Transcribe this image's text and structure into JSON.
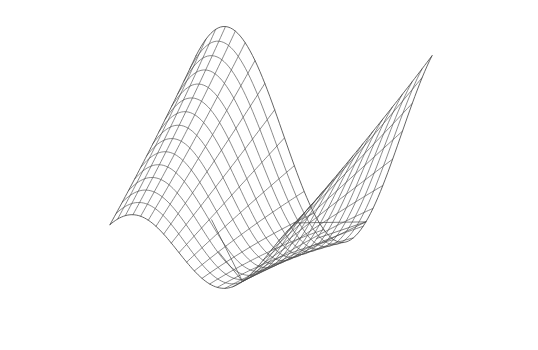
{
  "figure": {
    "title": "",
    "background_color": "#ffffff",
    "width": 538,
    "height": 350,
    "caption_fragment": ""
  },
  "chart_data": {
    "type": "line",
    "subtype": "3d-wireframe-surface",
    "title": "",
    "subtitle": "",
    "xlabel": "",
    "ylabel": "",
    "zlabel": "",
    "grid": false,
    "legend": false,
    "legend_position": "none",
    "axes_visible": false,
    "tick_labels_x": [],
    "tick_labels_y": [],
    "tick_labels_z": [],
    "annotations": [],
    "surface": {
      "description": "Single-period sinusoidal ridge-and-valley (saddle-like wave) surface drawn as a quadrilateral wireframe mesh with no shading or fill.",
      "function": "z = amplitude * cos(2*pi*(u - phase))",
      "amplitude": 1.0,
      "phase": 0.12,
      "u_range": [
        0,
        1
      ],
      "v_range": [
        0,
        1
      ],
      "u_divisions": 24,
      "v_divisions": 14,
      "wire_color": "#4a4a4a",
      "wire_width": 0.7,
      "hidden_line_removal": false
    },
    "projection": {
      "type": "oblique-perspective",
      "azimuth_deg": -48,
      "elevation_deg": 22,
      "origin_px": [
        258,
        176
      ],
      "scale_x_px": 236,
      "scale_y_px": 118,
      "scale_z_px": 108,
      "shear_px": 112
    },
    "chords": [
      {
        "name": "chord-top-node-to-valley",
        "from_uv": [
          0.72,
          0.0
        ],
        "to_uv": [
          0.72,
          1.0
        ]
      },
      {
        "name": "chord-upper-fan-a",
        "from_uv": [
          0.72,
          0.0
        ],
        "to_uv": [
          0.46,
          0.22
        ]
      },
      {
        "name": "chord-upper-fan-b",
        "from_uv": [
          0.72,
          0.0
        ],
        "to_uv": [
          0.38,
          0.3
        ]
      },
      {
        "name": "chord-valley-fan-a",
        "from_uv": [
          0.72,
          1.0
        ],
        "to_uv": [
          0.5,
          0.82
        ]
      },
      {
        "name": "chord-valley-fan-b",
        "from_uv": [
          0.72,
          1.0
        ],
        "to_uv": [
          0.56,
          0.9
        ]
      }
    ],
    "features": [
      {
        "name": "crest-ridge",
        "location_px": [
          360,
          55
        ],
        "note": "high arc along the rear of the surface"
      },
      {
        "name": "saddle-trough",
        "location_px": [
          330,
          280
        ],
        "note": "deep valley sweeping to the lower right"
      },
      {
        "name": "left-lobe",
        "location_px": [
          95,
          235
        ],
        "note": "small upturned lobe at far left"
      },
      {
        "name": "pinch-node",
        "location_px": [
          168,
          192
        ],
        "note": "dense convergence of mesh lines where the surface folds"
      }
    ]
  }
}
